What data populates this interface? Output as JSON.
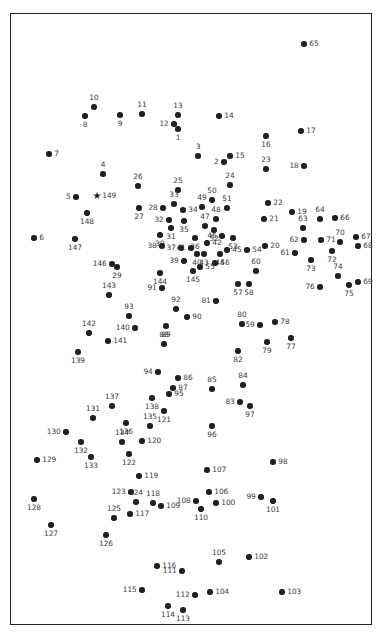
{
  "figure": {
    "title": "",
    "background_color": "#ffffff",
    "frame_color": "#231f20",
    "point_color": "#231f20",
    "label_color": "#3a3a3c"
  },
  "chart_data": {
    "type": "scatter",
    "title": "",
    "xlabel": "",
    "ylabel": "",
    "xlim": [
      0,
      362
    ],
    "ylim": [
      0,
      612
    ],
    "grid": false,
    "legend": null,
    "axis_ticks": false,
    "series": [
      {
        "name": "sites",
        "marker": "circle",
        "points": [
          {
            "id": "1",
            "x": 167,
            "y": 115,
            "lp": "b"
          },
          {
            "id": "2",
            "x": 213,
            "y": 148,
            "lp": "l"
          },
          {
            "id": "3",
            "x": 187,
            "y": 142,
            "lp": "t"
          },
          {
            "id": "4",
            "x": 92,
            "y": 160,
            "lp": "t"
          },
          {
            "id": "5",
            "x": 65,
            "y": 183,
            "lp": "l"
          },
          {
            "id": "6",
            "x": 23,
            "y": 224,
            "lp": "r"
          },
          {
            "id": "7",
            "x": 38,
            "y": 140,
            "lp": "r"
          },
          {
            "id": "8",
            "x": 74,
            "y": 102,
            "lp": "b"
          },
          {
            "id": "9",
            "x": 109,
            "y": 101,
            "lp": "b"
          },
          {
            "id": "10",
            "x": 83,
            "y": 93,
            "lp": "t"
          },
          {
            "id": "11",
            "x": 131,
            "y": 100,
            "lp": "t"
          },
          {
            "id": "12",
            "x": 163,
            "y": 110,
            "lp": "l"
          },
          {
            "id": "13",
            "x": 167,
            "y": 101,
            "lp": "t"
          },
          {
            "id": "14",
            "x": 208,
            "y": 102,
            "lp": "r"
          },
          {
            "id": "15",
            "x": 219,
            "y": 142,
            "lp": "r"
          },
          {
            "id": "16",
            "x": 255,
            "y": 122,
            "lp": "b"
          },
          {
            "id": "17",
            "x": 290,
            "y": 117,
            "lp": "r"
          },
          {
            "id": "18",
            "x": 293,
            "y": 152,
            "lp": "l"
          },
          {
            "id": "19",
            "x": 281,
            "y": 198,
            "lp": "r"
          },
          {
            "id": "20",
            "x": 254,
            "y": 232,
            "lp": "r"
          },
          {
            "id": "21",
            "x": 253,
            "y": 205,
            "lp": "r"
          },
          {
            "id": "22",
            "x": 257,
            "y": 189,
            "lp": "r"
          },
          {
            "id": "23",
            "x": 255,
            "y": 155,
            "lp": "t"
          },
          {
            "id": "24",
            "x": 219,
            "y": 171,
            "lp": "t"
          },
          {
            "id": "25",
            "x": 167,
            "y": 176,
            "lp": "t"
          },
          {
            "id": "26",
            "x": 127,
            "y": 172,
            "lp": "t"
          },
          {
            "id": "27",
            "x": 128,
            "y": 194,
            "lp": "b"
          },
          {
            "id": "28",
            "x": 152,
            "y": 194,
            "lp": "l"
          },
          {
            "id": "29",
            "x": 106,
            "y": 253,
            "lp": "b"
          },
          {
            "id": "30",
            "x": 149,
            "y": 221,
            "lp": "b"
          },
          {
            "id": "31",
            "x": 160,
            "y": 214,
            "lp": "b"
          },
          {
            "id": "32",
            "x": 158,
            "y": 206,
            "lp": "l"
          },
          {
            "id": "33",
            "x": 163,
            "y": 190,
            "lp": "t"
          },
          {
            "id": "34",
            "x": 172,
            "y": 196,
            "lp": "r"
          },
          {
            "id": "35",
            "x": 173,
            "y": 207,
            "lp": "b"
          },
          {
            "id": "36",
            "x": 184,
            "y": 224,
            "lp": "b"
          },
          {
            "id": "37",
            "x": 170,
            "y": 234,
            "lp": "l"
          },
          {
            "id": "38",
            "x": 151,
            "y": 232,
            "lp": "l"
          },
          {
            "id": "39",
            "x": 173,
            "y": 247,
            "lp": "l"
          },
          {
            "id": "40",
            "x": 186,
            "y": 240,
            "lp": "b"
          },
          {
            "id": "41",
            "x": 180,
            "y": 234,
            "lp": "l"
          },
          {
            "id": "42",
            "x": 196,
            "y": 229,
            "lp": "r"
          },
          {
            "id": "43",
            "x": 193,
            "y": 240,
            "lp": "b"
          },
          {
            "id": "44",
            "x": 209,
            "y": 240,
            "lp": "b"
          },
          {
            "id": "45",
            "x": 216,
            "y": 236,
            "lp": "r"
          },
          {
            "id": "46",
            "x": 211,
            "y": 222,
            "lp": "l"
          },
          {
            "id": "47",
            "x": 194,
            "y": 212,
            "lp": "t"
          },
          {
            "id": "48",
            "x": 205,
            "y": 205,
            "lp": "t"
          },
          {
            "id": "49",
            "x": 191,
            "y": 193,
            "lp": "t"
          },
          {
            "id": "50",
            "x": 201,
            "y": 186,
            "lp": "t"
          },
          {
            "id": "51",
            "x": 216,
            "y": 194,
            "lp": "t"
          },
          {
            "id": "52",
            "x": 203,
            "y": 216,
            "lp": "b"
          },
          {
            "id": "53",
            "x": 222,
            "y": 224,
            "lp": "b"
          },
          {
            "id": "54",
            "x": 236,
            "y": 236,
            "lp": "r"
          },
          {
            "id": "55",
            "x": 189,
            "y": 253,
            "lp": "r"
          },
          {
            "id": "56",
            "x": 204,
            "y": 249,
            "lp": "r"
          },
          {
            "id": "57",
            "x": 227,
            "y": 270,
            "lp": "b"
          },
          {
            "id": "58",
            "x": 238,
            "y": 270,
            "lp": "b"
          },
          {
            "id": "59",
            "x": 249,
            "y": 311,
            "lp": "l"
          },
          {
            "id": "60",
            "x": 245,
            "y": 257,
            "lp": "t"
          },
          {
            "id": "61",
            "x": 284,
            "y": 239,
            "lp": "l"
          },
          {
            "id": "62",
            "x": 293,
            "y": 226,
            "lp": "l"
          },
          {
            "id": "63",
            "x": 292,
            "y": 214,
            "lp": "t"
          },
          {
            "id": "64",
            "x": 309,
            "y": 205,
            "lp": "t"
          },
          {
            "id": "65",
            "x": 293,
            "y": 30,
            "lp": "r"
          },
          {
            "id": "66",
            "x": 324,
            "y": 204,
            "lp": "r"
          },
          {
            "id": "67",
            "x": 345,
            "y": 223,
            "lp": "r"
          },
          {
            "id": "68",
            "x": 347,
            "y": 232,
            "lp": "r"
          },
          {
            "id": "69",
            "x": 347,
            "y": 268,
            "lp": "r"
          },
          {
            "id": "70",
            "x": 329,
            "y": 228,
            "lp": "t"
          },
          {
            "id": "71",
            "x": 310,
            "y": 226,
            "lp": "r"
          },
          {
            "id": "72",
            "x": 321,
            "y": 237,
            "lp": "b"
          },
          {
            "id": "73",
            "x": 300,
            "y": 246,
            "lp": "b"
          },
          {
            "id": "74",
            "x": 327,
            "y": 262,
            "lp": "t"
          },
          {
            "id": "75",
            "x": 338,
            "y": 271,
            "lp": "b"
          },
          {
            "id": "76",
            "x": 309,
            "y": 273,
            "lp": "l"
          },
          {
            "id": "77",
            "x": 280,
            "y": 324,
            "lp": "b"
          },
          {
            "id": "78",
            "x": 264,
            "y": 308,
            "lp": "r"
          },
          {
            "id": "79",
            "x": 256,
            "y": 328,
            "lp": "b"
          },
          {
            "id": "80",
            "x": 231,
            "y": 310,
            "lp": "t"
          },
          {
            "id": "81",
            "x": 205,
            "y": 287,
            "lp": "l"
          },
          {
            "id": "82",
            "x": 227,
            "y": 337,
            "lp": "b"
          },
          {
            "id": "83",
            "x": 229,
            "y": 388,
            "lp": "l"
          },
          {
            "id": "84",
            "x": 232,
            "y": 371,
            "lp": "t"
          },
          {
            "id": "85",
            "x": 201,
            "y": 375,
            "lp": "t"
          },
          {
            "id": "86",
            "x": 167,
            "y": 364,
            "lp": "r"
          },
          {
            "id": "87",
            "x": 162,
            "y": 374,
            "lp": "r"
          },
          {
            "id": "88",
            "x": 153,
            "y": 330,
            "lp": "t"
          },
          {
            "id": "89",
            "x": 155,
            "y": 312,
            "lp": "b"
          },
          {
            "id": "90",
            "x": 176,
            "y": 303,
            "lp": "r"
          },
          {
            "id": "91",
            "x": 151,
            "y": 274,
            "lp": "l"
          },
          {
            "id": "92",
            "x": 165,
            "y": 295,
            "lp": "t"
          },
          {
            "id": "93",
            "x": 118,
            "y": 302,
            "lp": "t"
          },
          {
            "id": "94",
            "x": 147,
            "y": 358,
            "lp": "l"
          },
          {
            "id": "95",
            "x": 158,
            "y": 380,
            "lp": "r"
          },
          {
            "id": "96",
            "x": 201,
            "y": 412,
            "lp": "b"
          },
          {
            "id": "97",
            "x": 239,
            "y": 392,
            "lp": "b"
          },
          {
            "id": "98",
            "x": 262,
            "y": 448,
            "lp": "r"
          },
          {
            "id": "99",
            "x": 250,
            "y": 483,
            "lp": "l"
          },
          {
            "id": "100",
            "x": 205,
            "y": 489,
            "lp": "r"
          },
          {
            "id": "101",
            "x": 262,
            "y": 487,
            "lp": "b"
          },
          {
            "id": "102",
            "x": 238,
            "y": 543,
            "lp": "r"
          },
          {
            "id": "103",
            "x": 271,
            "y": 578,
            "lp": "r"
          },
          {
            "id": "104",
            "x": 199,
            "y": 578,
            "lp": "r"
          },
          {
            "id": "105",
            "x": 208,
            "y": 548,
            "lp": "t"
          },
          {
            "id": "106",
            "x": 198,
            "y": 478,
            "lp": "r"
          },
          {
            "id": "107",
            "x": 196,
            "y": 456,
            "lp": "r"
          },
          {
            "id": "108",
            "x": 185,
            "y": 487,
            "lp": "l"
          },
          {
            "id": "109",
            "x": 150,
            "y": 492,
            "lp": "r"
          },
          {
            "id": "110",
            "x": 190,
            "y": 495,
            "lp": "b"
          },
          {
            "id": "111",
            "x": 171,
            "y": 557,
            "lp": "l"
          },
          {
            "id": "112",
            "x": 184,
            "y": 581,
            "lp": "l"
          },
          {
            "id": "113",
            "x": 172,
            "y": 596,
            "lp": "b"
          },
          {
            "id": "114",
            "x": 157,
            "y": 592,
            "lp": "b"
          },
          {
            "id": "115",
            "x": 131,
            "y": 576,
            "lp": "l"
          },
          {
            "id": "116",
            "x": 146,
            "y": 552,
            "lp": "r"
          },
          {
            "id": "117",
            "x": 119,
            "y": 500,
            "lp": "r"
          },
          {
            "id": "118",
            "x": 142,
            "y": 489,
            "lp": "t"
          },
          {
            "id": "119",
            "x": 128,
            "y": 462,
            "lp": "r"
          },
          {
            "id": "120",
            "x": 131,
            "y": 427,
            "lp": "r"
          },
          {
            "id": "121",
            "x": 153,
            "y": 397,
            "lp": "b"
          },
          {
            "id": "122",
            "x": 118,
            "y": 440,
            "lp": "b"
          },
          {
            "id": "123",
            "x": 120,
            "y": 478,
            "lp": "l"
          },
          {
            "id": "124",
            "x": 125,
            "y": 488,
            "lp": "t"
          },
          {
            "id": "125",
            "x": 103,
            "y": 504,
            "lp": "t"
          },
          {
            "id": "126",
            "x": 95,
            "y": 521,
            "lp": "b"
          },
          {
            "id": "127",
            "x": 40,
            "y": 511,
            "lp": "b"
          },
          {
            "id": "128",
            "x": 23,
            "y": 485,
            "lp": "b"
          },
          {
            "id": "129",
            "x": 26,
            "y": 446,
            "lp": "r"
          },
          {
            "id": "130",
            "x": 55,
            "y": 418,
            "lp": "l"
          },
          {
            "id": "131",
            "x": 82,
            "y": 404,
            "lp": "t"
          },
          {
            "id": "132",
            "x": 70,
            "y": 428,
            "lp": "b"
          },
          {
            "id": "133",
            "x": 80,
            "y": 443,
            "lp": "b"
          },
          {
            "id": "134",
            "x": 111,
            "y": 428,
            "lp": "t"
          },
          {
            "id": "135",
            "x": 139,
            "y": 412,
            "lp": "t"
          },
          {
            "id": "136",
            "x": 115,
            "y": 409,
            "lp": "b"
          },
          {
            "id": "137",
            "x": 101,
            "y": 392,
            "lp": "t"
          },
          {
            "id": "138",
            "x": 141,
            "y": 384,
            "lp": "b"
          },
          {
            "id": "139",
            "x": 67,
            "y": 338,
            "lp": "b"
          },
          {
            "id": "140",
            "x": 124,
            "y": 314,
            "lp": "l"
          },
          {
            "id": "141",
            "x": 97,
            "y": 327,
            "lp": "r"
          },
          {
            "id": "142",
            "x": 78,
            "y": 319,
            "lp": "t"
          },
          {
            "id": "143",
            "x": 98,
            "y": 281,
            "lp": "t"
          },
          {
            "id": "144",
            "x": 149,
            "y": 259,
            "lp": "b"
          },
          {
            "id": "145",
            "x": 182,
            "y": 257,
            "lp": "b"
          },
          {
            "id": "146",
            "x": 101,
            "y": 250,
            "lp": "l"
          },
          {
            "id": "147",
            "x": 64,
            "y": 225,
            "lp": "b"
          },
          {
            "id": "148",
            "x": 76,
            "y": 199,
            "lp": "b"
          }
        ]
      },
      {
        "name": "reference-site",
        "marker": "star",
        "points": [
          {
            "id": "149",
            "x": 86,
            "y": 182,
            "lp": "r"
          }
        ]
      }
    ]
  }
}
